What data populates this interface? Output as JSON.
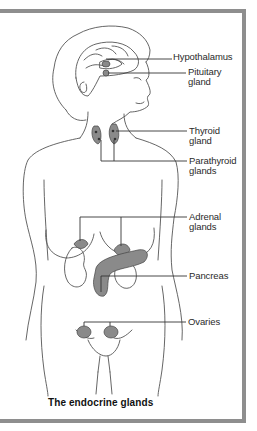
{
  "figure": {
    "title": "The endocrine glands",
    "frame_color": "#8e8e8e",
    "line_color": "#444444",
    "gland_fill": "#7a7a7a",
    "labels": [
      {
        "id": "hypothalamus",
        "text": "Hypothalamus"
      },
      {
        "id": "pituitary",
        "text": "Pituitary\ngland"
      },
      {
        "id": "thyroid",
        "text": "Thyroid\ngland"
      },
      {
        "id": "parathyroid",
        "text": "Parathyroid\nglands"
      },
      {
        "id": "adrenal",
        "text": "Adrenal\nglands"
      },
      {
        "id": "pancreas",
        "text": "Pancreas"
      },
      {
        "id": "ovaries",
        "text": "Ovaries"
      }
    ]
  }
}
